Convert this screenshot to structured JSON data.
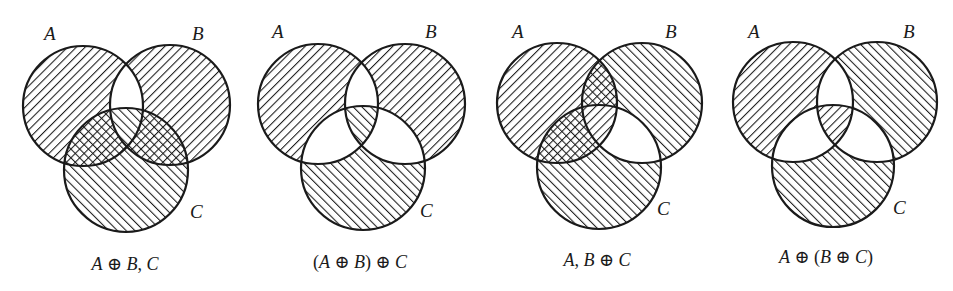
{
  "figure": {
    "width": 953,
    "height": 291,
    "ink_color": "#1a1a1a",
    "background_color": "#ffffff",
    "hatch_legend": {
      "back": "diagonal lines top-left to bottom-right (\\\\)",
      "fwd": "diagonal lines bottom-left to top-right (/)",
      "cross": "both diagonals (crosshatch)",
      "none": "unshaded"
    }
  },
  "diagrams": [
    {
      "caption": "A ⊕ B, C",
      "caption_parts": [
        "A",
        " ⊕ ",
        "B",
        ", ",
        "C"
      ],
      "labels": {
        "a": "A",
        "b": "B",
        "c": "C"
      },
      "circles": {
        "a": [
          83,
          106,
          60
        ],
        "b": [
          170,
          105,
          60
        ],
        "c": [
          126,
          170,
          62
        ]
      },
      "label_pos": {
        "a": [
          44,
          40
        ],
        "b": [
          192,
          40
        ],
        "c": [
          190,
          218
        ]
      },
      "caption_pos": [
        125,
        270
      ],
      "regions": {
        "a_only": "back",
        "b_only": "back",
        "c_only": "fwd",
        "ab": "none",
        "ac": "cross",
        "bc": "cross",
        "abc": "fwd"
      }
    },
    {
      "caption": "(A ⊕ B) ⊕ C",
      "caption_parts": [
        "(",
        "A",
        " ⊕ ",
        "B",
        ") ⊕ ",
        "C"
      ],
      "labels": {
        "a": "A",
        "b": "B",
        "c": "C"
      },
      "circles": {
        "a": [
          318,
          104,
          60
        ],
        "b": [
          405,
          104,
          60
        ],
        "c": [
          363,
          168,
          62
        ]
      },
      "label_pos": {
        "a": [
          272,
          38
        ],
        "b": [
          425,
          38
        ],
        "c": [
          420,
          217
        ]
      },
      "caption_pos": [
        360,
        268
      ],
      "regions": {
        "a_only": "back",
        "b_only": "back",
        "c_only": "fwd",
        "ab": "none",
        "ac": "none",
        "bc": "none",
        "abc": "fwd"
      }
    },
    {
      "caption": "A, B ⊕ C",
      "caption_parts": [
        "A",
        ", ",
        "B",
        " ⊕ ",
        "C"
      ],
      "labels": {
        "a": "A",
        "b": "B",
        "c": "C"
      },
      "circles": {
        "a": [
          557,
          103,
          60
        ],
        "b": [
          642,
          103,
          60
        ],
        "c": [
          599,
          167,
          62
        ]
      },
      "label_pos": {
        "a": [
          512,
          38
        ],
        "b": [
          665,
          38
        ],
        "c": [
          657,
          215
        ]
      },
      "caption_pos": [
        597,
        266
      ],
      "regions": {
        "a_only": "back",
        "b_only": "fwd",
        "c_only": "fwd",
        "ab": "cross",
        "ac": "cross",
        "bc": "none",
        "abc": "back"
      }
    },
    {
      "caption": "A ⊕ (B ⊕ C)",
      "caption_parts": [
        "A",
        " ⊕ (",
        "B",
        " ⊕ ",
        "C",
        ")"
      ],
      "labels": {
        "a": "A",
        "b": "B",
        "c": "C"
      },
      "circles": {
        "a": [
          793,
          102,
          60
        ],
        "b": [
          877,
          102,
          60
        ],
        "c": [
          833,
          166,
          61
        ]
      },
      "label_pos": {
        "a": [
          748,
          38
        ],
        "b": [
          903,
          38
        ],
        "c": [
          893,
          214
        ]
      },
      "caption_pos": [
        826,
        263
      ],
      "regions": {
        "a_only": "back",
        "b_only": "fwd",
        "c_only": "fwd",
        "ab": "none",
        "ac": "none",
        "bc": "none",
        "abc": "back"
      }
    }
  ]
}
